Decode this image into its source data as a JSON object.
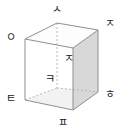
{
  "figure": {
    "type": "rectangular-prism",
    "projection": "oblique",
    "background_color": "#ffffff",
    "edge_color": "#8c8c8c",
    "hidden_edge_color": "#b4b4b4",
    "shaded_face_color": "#d8d8d8",
    "top_face_color": "#fcfcfc",
    "bottom_face_color": "#f0f0f0",
    "label_color": "#1a1a1a"
  },
  "labels": {
    "top_back": "ㅅ",
    "top_left_front": "ㅇ",
    "top_right_back": "ㅈ",
    "top_right_front": "ㅈ",
    "bottom_back_hidden": "ㅋ",
    "bottom_left_front": "ㅌ",
    "bottom_right_back": "ㅎ",
    "bottom_right_front": "ㅍ"
  },
  "vertices": {
    "top_back": {
      "x": 57,
      "y": 23
    },
    "top_left_front": {
      "x": 25,
      "y": 39
    },
    "top_right_back": {
      "x": 98,
      "y": 30
    },
    "top_right_front": {
      "x": 73,
      "y": 48
    },
    "bottom_back_hidden": {
      "x": 57,
      "y": 88
    },
    "bottom_left_front": {
      "x": 25,
      "y": 100
    },
    "bottom_right_back": {
      "x": 98,
      "y": 92
    },
    "bottom_right_front": {
      "x": 73,
      "y": 110
    }
  },
  "label_positions": {
    "top_back": {
      "x": 57,
      "y": 10
    },
    "top_left_front": {
      "x": 11,
      "y": 38
    },
    "top_right_back": {
      "x": 110,
      "y": 24
    },
    "top_right_front": {
      "x": 69,
      "y": 59
    },
    "bottom_back_hidden": {
      "x": 50,
      "y": 80
    },
    "bottom_left_front": {
      "x": 11,
      "y": 99
    },
    "bottom_right_back": {
      "x": 110,
      "y": 95
    },
    "bottom_right_front": {
      "x": 63,
      "y": 123
    }
  }
}
